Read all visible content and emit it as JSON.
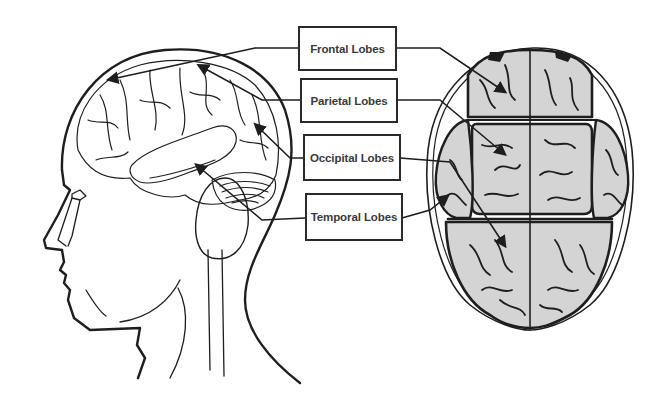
{
  "diagram": {
    "type": "anatomical-labeled-diagram",
    "figures": [
      {
        "name": "head-profile",
        "description": "Side view of human head with brain outline"
      },
      {
        "name": "brain-top-view",
        "description": "Top-down view of brain with lobe regions outlined"
      }
    ],
    "labels": [
      {
        "id": "frontal",
        "text": "Frontal Lobes"
      },
      {
        "id": "parietal",
        "text": "Parietal Lobes"
      },
      {
        "id": "occipital",
        "text": "Occipital Lobes"
      },
      {
        "id": "temporal",
        "text": "Temporal Lobes"
      }
    ],
    "colors": {
      "line": "#1e1e1e",
      "brain_fill": "#d4d4d4",
      "label_text": "#3a3a3a",
      "background": "#ffffff"
    }
  }
}
